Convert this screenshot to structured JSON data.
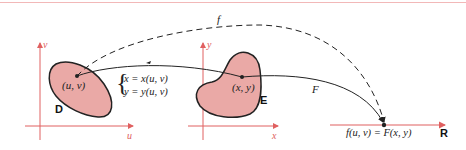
{
  "diagram": {
    "domain_label": "D",
    "image_label": "E",
    "range_label": "R",
    "domain_point": "(u, v)",
    "image_point": "(x, y)",
    "domain_axes": {
      "x": "u",
      "y": "v"
    },
    "image_axes": {
      "x": "x",
      "y": "y"
    },
    "transformation": {
      "line1": "x = x(u, v)",
      "line2": "y = y(u, v)"
    },
    "map_F": "F",
    "map_f": "f",
    "result": "f(u, v) = F(x, y)",
    "colors": {
      "axis": "#e06060",
      "region_fill": "#eaa9a6",
      "stroke": "#222222"
    }
  }
}
